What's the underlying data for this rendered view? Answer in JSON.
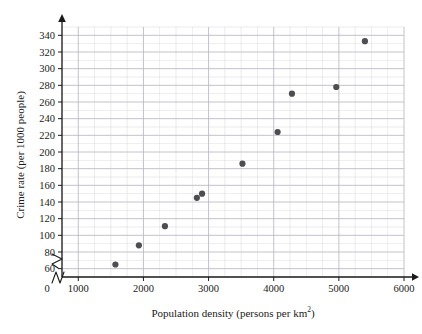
{
  "chart_data": {
    "type": "scatter",
    "title": "",
    "xlabel": "Population density (persons per km²)",
    "xlabel_main": "Population density (persons per km",
    "xlabel_sup": "2",
    "xlabel_tail": ")",
    "ylabel": "Crime rate (per 1000 people)",
    "xlim": [
      750,
      6000
    ],
    "ylim": [
      50,
      350
    ],
    "x_ticks": [
      1000,
      2000,
      3000,
      4000,
      5000,
      6000
    ],
    "y_ticks": [
      60,
      80,
      100,
      120,
      140,
      160,
      180,
      200,
      220,
      240,
      260,
      280,
      300,
      320,
      340
    ],
    "origin_label": "0",
    "x_minor_step": 250,
    "y_minor_step": 10,
    "grid": true,
    "legend": "none",
    "axis_break_x": true,
    "axis_break_y": true,
    "marker": "filled-circle",
    "marker_color": "#4d4d52",
    "grid_color": "#b9b9c4",
    "axis_color": "#1a1a1a",
    "points": [
      {
        "x": 1570,
        "y": 65
      },
      {
        "x": 1930,
        "y": 88
      },
      {
        "x": 2330,
        "y": 111
      },
      {
        "x": 2820,
        "y": 145
      },
      {
        "x": 2900,
        "y": 150
      },
      {
        "x": 3520,
        "y": 186
      },
      {
        "x": 4060,
        "y": 224
      },
      {
        "x": 4280,
        "y": 270
      },
      {
        "x": 4960,
        "y": 278
      },
      {
        "x": 5400,
        "y": 333
      }
    ]
  }
}
